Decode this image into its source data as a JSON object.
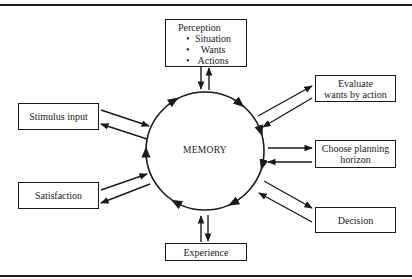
{
  "diagram": {
    "center": {
      "label": "MEMORY"
    },
    "nodes": {
      "perception": {
        "title": "Perception",
        "bullets": [
          "Situation",
          "Wants",
          "Actions"
        ]
      },
      "stimulus_input": {
        "label": "Stimulus input"
      },
      "satisfaction": {
        "label": "Satisfaction"
      },
      "evaluate": {
        "line1": "Evaluate",
        "line2": "wants by action"
      },
      "choose_planning_horizon": {
        "line1": "Choose planning",
        "line2": "horizon"
      },
      "decision": {
        "label": "Decision"
      },
      "experience": {
        "label": "Experience"
      }
    },
    "cycle_direction": "clockwise",
    "connections": [
      {
        "from": "memory",
        "to": "perception",
        "bidirectional": true
      },
      {
        "from": "memory",
        "to": "stimulus_input",
        "bidirectional": true
      },
      {
        "from": "memory",
        "to": "satisfaction",
        "bidirectional": true
      },
      {
        "from": "memory",
        "to": "evaluate",
        "bidirectional": true
      },
      {
        "from": "memory",
        "to": "choose_planning_horizon",
        "bidirectional": true
      },
      {
        "from": "memory",
        "to": "decision",
        "bidirectional": true
      },
      {
        "from": "memory",
        "to": "experience",
        "bidirectional": true
      }
    ],
    "colors": {
      "line": "#1a1a1a",
      "background": "#ffffff"
    }
  }
}
